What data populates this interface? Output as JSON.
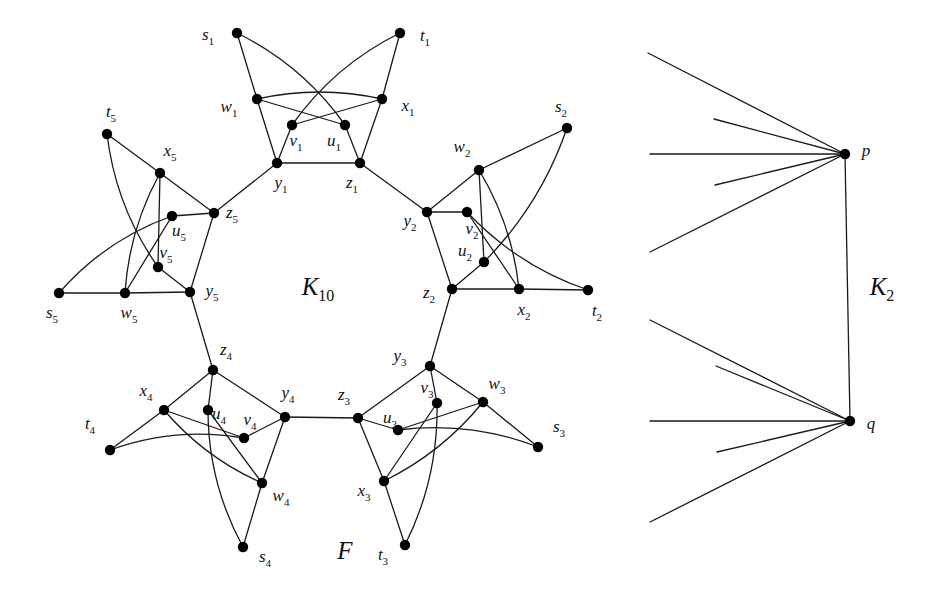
{
  "figure": {
    "background_color": "#ffffff",
    "stroke_color": "#1a1a1a",
    "vertex_color": "#000000",
    "vertex_radius": 5.2,
    "edge_width": 1.3
  },
  "labels": {
    "k10": "K",
    "k10_sub": "10",
    "k2": "K",
    "k2_sub": "2",
    "f": "F",
    "p": "p",
    "q": "q"
  },
  "label_positions": {
    "k10": {
      "x": 318,
      "y": 289
    },
    "k2": {
      "x": 882,
      "y": 289
    },
    "f": {
      "x": 345,
      "y": 551
    },
    "p": {
      "x": 866,
      "y": 151
    },
    "q": {
      "x": 871,
      "y": 424
    }
  },
  "graph_F": {
    "name": "F",
    "petal_count": 5,
    "vertices_per_petal": 8,
    "vertex_letters": [
      "s",
      "t",
      "u",
      "v",
      "w",
      "x",
      "y",
      "z"
    ],
    "petals": [
      {
        "index": 1,
        "nodes": {
          "s": {
            "x": 237,
            "y": 33,
            "label": "s",
            "sub": "1",
            "lx": 208,
            "ly": 36
          },
          "t": {
            "x": 400,
            "y": 33,
            "label": "t",
            "sub": "1",
            "lx": 425,
            "ly": 37
          },
          "w": {
            "x": 257,
            "y": 99,
            "label": "w",
            "sub": "1",
            "lx": 229,
            "ly": 108
          },
          "x": {
            "x": 382,
            "y": 99,
            "label": "x",
            "sub": "1",
            "lx": 408,
            "ly": 107
          },
          "v": {
            "x": 292,
            "y": 125,
            "label": "v",
            "sub": "1",
            "lx": 296,
            "ly": 142
          },
          "u": {
            "x": 345,
            "y": 125,
            "label": "u",
            "sub": "1",
            "lx": 334,
            "ly": 142
          },
          "y": {
            "x": 277,
            "y": 163,
            "label": "y",
            "sub": "1",
            "lx": 281,
            "ly": 184
          },
          "z": {
            "x": 360,
            "y": 163,
            "label": "z",
            "sub": "1",
            "lx": 352,
            "ly": 184
          }
        }
      },
      {
        "index": 2,
        "nodes": {
          "s": {
            "x": 567,
            "y": 128,
            "label": "s",
            "sub": "2",
            "lx": 561,
            "ly": 108
          },
          "t": {
            "x": 588,
            "y": 290,
            "label": "t",
            "sub": "2",
            "lx": 597,
            "ly": 312
          },
          "w": {
            "x": 479,
            "y": 170,
            "label": "w",
            "sub": "2",
            "lx": 462,
            "ly": 148
          },
          "x": {
            "x": 519,
            "y": 289,
            "label": "x",
            "sub": "2",
            "lx": 524,
            "ly": 311
          },
          "v": {
            "x": 467,
            "y": 212,
            "label": "v",
            "sub": "2",
            "lx": 472,
            "ly": 230
          },
          "u": {
            "x": 484,
            "y": 262,
            "label": "u",
            "sub": "2",
            "lx": 465,
            "ly": 252
          },
          "y": {
            "x": 427,
            "y": 212,
            "label": "y",
            "sub": "2",
            "lx": 410,
            "ly": 222
          },
          "z": {
            "x": 452,
            "y": 289,
            "label": "z",
            "sub": "2",
            "lx": 429,
            "ly": 294
          }
        }
      },
      {
        "index": 3,
        "nodes": {
          "s": {
            "x": 538,
            "y": 447,
            "label": "s",
            "sub": "3",
            "lx": 559,
            "ly": 428
          },
          "t": {
            "x": 405,
            "y": 545,
            "label": "t",
            "sub": "3",
            "lx": 383,
            "ly": 556
          },
          "w": {
            "x": 483,
            "y": 402,
            "label": "w",
            "sub": "3",
            "lx": 497,
            "ly": 385
          },
          "x": {
            "x": 384,
            "y": 481,
            "label": "x",
            "sub": "3",
            "lx": 364,
            "ly": 492
          },
          "v": {
            "x": 437,
            "y": 403,
            "label": "v",
            "sub": "3",
            "lx": 427,
            "ly": 389
          },
          "u": {
            "x": 398,
            "y": 430,
            "label": "u",
            "sub": "3",
            "lx": 390,
            "ly": 419
          },
          "y": {
            "x": 430,
            "y": 366,
            "label": "y",
            "sub": "3",
            "lx": 400,
            "ly": 357
          },
          "z": {
            "x": 358,
            "y": 418,
            "label": "z",
            "sub": "3",
            "lx": 344,
            "ly": 396
          }
        }
      },
      {
        "index": 4,
        "nodes": {
          "s": {
            "x": 243,
            "y": 547,
            "label": "s",
            "sub": "4",
            "lx": 265,
            "ly": 558
          },
          "t": {
            "x": 110,
            "y": 450,
            "label": "t",
            "sub": "4",
            "lx": 90,
            "ly": 425
          },
          "w": {
            "x": 262,
            "y": 483,
            "label": "w",
            "sub": "4",
            "lx": 281,
            "ly": 497
          },
          "x": {
            "x": 164,
            "y": 410,
            "label": "x",
            "sub": "4",
            "lx": 146,
            "ly": 392
          },
          "v": {
            "x": 244,
            "y": 438,
            "label": "v",
            "sub": "4",
            "lx": 250,
            "ly": 421
          },
          "u": {
            "x": 208,
            "y": 410,
            "label": "u",
            "sub": "4",
            "lx": 219,
            "ly": 415
          },
          "y": {
            "x": 285,
            "y": 417,
            "label": "y",
            "sub": "4",
            "lx": 288,
            "ly": 394
          },
          "z": {
            "x": 213,
            "y": 370,
            "label": "z",
            "sub": "4",
            "lx": 226,
            "ly": 351
          }
        }
      },
      {
        "index": 5,
        "nodes": {
          "s": {
            "x": 59,
            "y": 293,
            "label": "s",
            "sub": "5",
            "lx": 52,
            "ly": 314
          },
          "t": {
            "x": 107,
            "y": 134,
            "label": "t",
            "sub": "5",
            "lx": 111,
            "ly": 113
          },
          "w": {
            "x": 125,
            "y": 293,
            "label": "w",
            "sub": "5",
            "lx": 129,
            "ly": 314
          },
          "x": {
            "x": 160,
            "y": 173,
            "label": "x",
            "sub": "5",
            "lx": 170,
            "ly": 152
          },
          "v": {
            "x": 158,
            "y": 267,
            "label": "v",
            "sub": "5",
            "lx": 166,
            "ly": 254
          },
          "u": {
            "x": 172,
            "y": 216,
            "label": "u",
            "sub": "5",
            "lx": 179,
            "ly": 232
          },
          "y": {
            "x": 190,
            "y": 292,
            "label": "y",
            "sub": "5",
            "lx": 212,
            "ly": 292
          },
          "z": {
            "x": 214,
            "y": 213,
            "label": "z",
            "sub": "5",
            "lx": 232,
            "ly": 214
          }
        }
      }
    ],
    "petal_internal_edges": [
      {
        "from": "s",
        "to": "w",
        "curve": 0
      },
      {
        "from": "s",
        "to": "u",
        "curve": 18
      },
      {
        "from": "t",
        "to": "x",
        "curve": 0
      },
      {
        "from": "t",
        "to": "v",
        "curve": -18
      },
      {
        "from": "w",
        "to": "x",
        "curve": 14
      },
      {
        "from": "w",
        "to": "u",
        "curve": 0
      },
      {
        "from": "x",
        "to": "v",
        "curve": 0
      },
      {
        "from": "w",
        "to": "y",
        "curve": 0
      },
      {
        "from": "x",
        "to": "z",
        "curve": 0
      },
      {
        "from": "v",
        "to": "y",
        "curve": 0
      },
      {
        "from": "u",
        "to": "z",
        "curve": 0
      },
      {
        "from": "y",
        "to": "z",
        "curve": 0
      }
    ],
    "ring_edges": [
      {
        "from_petal": 5,
        "from_node": "z",
        "to_petal": 1,
        "to_node": "y"
      },
      {
        "from_petal": 1,
        "from_node": "z",
        "to_petal": 2,
        "to_node": "y"
      },
      {
        "from_petal": 2,
        "from_node": "z",
        "to_petal": 3,
        "to_node": "y"
      },
      {
        "from_petal": 3,
        "from_node": "z",
        "to_petal": 4,
        "to_node": "y"
      },
      {
        "from_petal": 4,
        "from_node": "z",
        "to_petal": 5,
        "to_node": "y"
      }
    ]
  },
  "graph_K2": {
    "name": "K2",
    "nodes": {
      "p": {
        "x": 845,
        "y": 154
      },
      "q": {
        "x": 850,
        "y": 421
      }
    },
    "edge_pq": {
      "from": "p",
      "to": "q"
    },
    "p_rays": [
      {
        "x": 648,
        "y": 53
      },
      {
        "x": 714,
        "y": 119
      },
      {
        "x": 650,
        "y": 154
      },
      {
        "x": 715,
        "y": 185
      },
      {
        "x": 650,
        "y": 252
      }
    ],
    "q_rays": [
      {
        "x": 650,
        "y": 320
      },
      {
        "x": 716,
        "y": 366
      },
      {
        "x": 650,
        "y": 421
      },
      {
        "x": 717,
        "y": 452
      },
      {
        "x": 650,
        "y": 522
      }
    ]
  }
}
